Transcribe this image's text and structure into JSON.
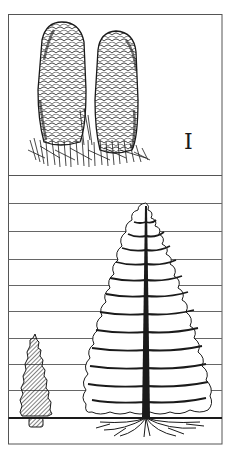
{
  "figure": {
    "top_panel": {
      "label": "I",
      "subject": "two upright conifer cones on a sprig of needles"
    },
    "bottom_panel": {
      "subject": "small potted/dwarf conifer beside a tall conifer with roots",
      "grid_lines": 9,
      "small_tree": "hatched dwarf conifer in pot",
      "large_tree": "tall conifer with central trunk, horizontal branches and spreading roots"
    },
    "colors": {
      "ink": "#1a1a1a",
      "frame": "#555555",
      "grid": "#666666",
      "background": "#ffffff"
    }
  }
}
